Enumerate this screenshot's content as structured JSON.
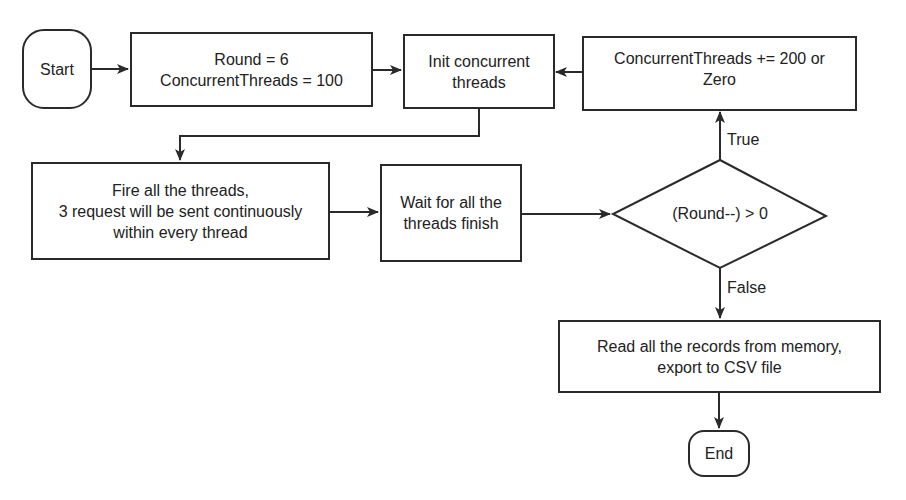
{
  "diagram": {
    "type": "flowchart",
    "nodes": {
      "start": {
        "label": "Start",
        "shape": "terminal"
      },
      "init_vars": {
        "lines": [
          "Round = 6",
          "ConcurrentThreads = 100"
        ],
        "shape": "process"
      },
      "init_threads": {
        "lines": [
          "Init concurrent",
          "threads"
        ],
        "shape": "process"
      },
      "increment": {
        "lines": [
          "ConcurrentThreads += 200 or",
          "Zero"
        ],
        "shape": "process"
      },
      "fire": {
        "lines": [
          "Fire all the threads,",
          "3 request will be sent continuously",
          "within every thread"
        ],
        "shape": "process"
      },
      "wait": {
        "lines": [
          "Wait for all the",
          "threads finish"
        ],
        "shape": "process"
      },
      "decision": {
        "label": "(Round--) > 0",
        "shape": "decision"
      },
      "export": {
        "lines": [
          "Read all the records from memory,",
          "export to CSV file"
        ],
        "shape": "process"
      },
      "end": {
        "label": "End",
        "shape": "terminal"
      }
    },
    "edges": [
      {
        "from": "start",
        "to": "init_vars"
      },
      {
        "from": "init_vars",
        "to": "init_threads"
      },
      {
        "from": "increment",
        "to": "init_threads"
      },
      {
        "from": "init_threads",
        "to": "fire"
      },
      {
        "from": "fire",
        "to": "wait"
      },
      {
        "from": "wait",
        "to": "decision"
      },
      {
        "from": "decision",
        "to": "increment",
        "label": "True"
      },
      {
        "from": "decision",
        "to": "export",
        "label": "False"
      },
      {
        "from": "export",
        "to": "end"
      }
    ],
    "edge_labels": {
      "true": "True",
      "false": "False"
    },
    "colors": {
      "stroke": "#2a2a2a",
      "background": "#ffffff",
      "text": "#222222"
    }
  }
}
